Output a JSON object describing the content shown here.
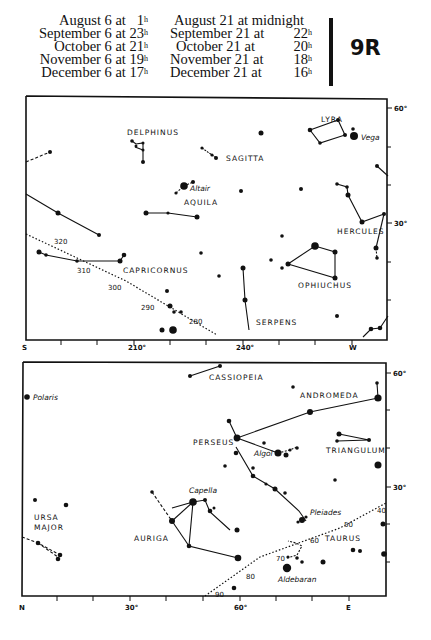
{
  "header": {
    "times_left": [
      {
        "label": "August 6 at",
        "hour": "1",
        "unit": "h"
      },
      {
        "label": "September 6 at",
        "hour": "23",
        "unit": "h"
      },
      {
        "label": "October 6 at",
        "hour": "21",
        "unit": "h"
      },
      {
        "label": "November 6 at",
        "hour": "19",
        "unit": "h"
      },
      {
        "label": "December 6 at",
        "hour": "17",
        "unit": "h"
      }
    ],
    "times_right": [
      {
        "label": "August 21 at midnight",
        "hour": "",
        "unit": ""
      },
      {
        "label": "September 21 at",
        "hour": "22",
        "unit": "h"
      },
      {
        "label": "October 21 at",
        "hour": "20",
        "unit": "h"
      },
      {
        "label": "November 21 at",
        "hour": "18",
        "unit": "h"
      },
      {
        "label": "December 21 at",
        "hour": "16",
        "unit": "h"
      }
    ],
    "chart_code": "9R"
  },
  "upper_chart": {
    "direction_left": "S",
    "direction_right": "W",
    "azimuth_labels": [
      "210°",
      "240°"
    ],
    "altitude_labels": [
      "60°",
      "30°"
    ],
    "constellations": [
      "DELPHINUS",
      "SAGITTA",
      "LYRA",
      "AQUILA",
      "HERCULES",
      "CAPRICORNUS",
      "OPHIUCHUS",
      "SERPENS"
    ],
    "stars": [
      "Vega",
      "Altair"
    ],
    "ecliptic_marks": [
      "320",
      "310",
      "300",
      "290",
      "280"
    ]
  },
  "lower_chart": {
    "direction_left": "N",
    "direction_right": "E",
    "azimuth_labels": [
      "30°",
      "60°"
    ],
    "altitude_labels": [
      "60°",
      "30°"
    ],
    "constellations": [
      "CASSIOPEIA",
      "ANDROMEDA",
      "PERSEUS",
      "TRIANGULUM",
      "URSA MAJOR",
      "AURIGA",
      "TAURUS"
    ],
    "stars": [
      "Polaris",
      "Algol",
      "Capella",
      "Pleiades",
      "Aldebaran"
    ],
    "ecliptic_marks": [
      "40",
      "50",
      "60",
      "70",
      "80",
      "90"
    ]
  }
}
